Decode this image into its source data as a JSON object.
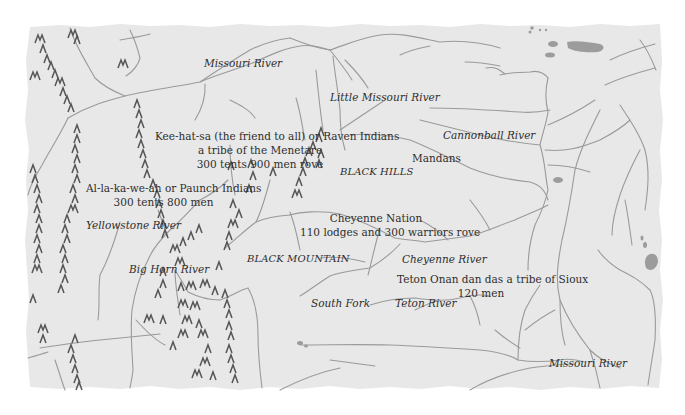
{
  "map": {
    "background_color": "#e8e8e8",
    "river_color": "#9a9a9a",
    "mountain_color": "#555555",
    "water_color": "#9c9c9c",
    "text_color": "#2e2e2e",
    "rivers": [
      {
        "id": "missouri-north",
        "label": "Missouri River"
      },
      {
        "id": "little-missouri",
        "label": "Little Missouri River"
      },
      {
        "id": "cannonball",
        "label": "Cannonball River"
      },
      {
        "id": "yellowstone",
        "label": "Yellowstone River"
      },
      {
        "id": "big-horn",
        "label": "Big Horn River"
      },
      {
        "id": "cheyenne",
        "label": "Cheyenne River"
      },
      {
        "id": "south-fork",
        "label": "South Fork"
      },
      {
        "id": "teton",
        "label": "Teton River"
      },
      {
        "id": "missouri-south",
        "label": "Missouri River"
      }
    ],
    "regions": [
      {
        "id": "black-hills",
        "label": "BLACK HILLS"
      },
      {
        "id": "black-mountain",
        "label": "BLACK MOUNTAIN"
      }
    ],
    "tribes": [
      {
        "id": "raven-indians",
        "lines": [
          "Kee-hat-sa (the friend to all) or Raven Indians",
          "a tribe of the Menetare",
          "300 tents 900 men rove"
        ]
      },
      {
        "id": "paunch-indians",
        "lines": [
          "Al-la-ka-we-ah or Paunch Indians",
          "300 tents 800 men"
        ]
      },
      {
        "id": "mandans",
        "lines": [
          "Mandans"
        ]
      },
      {
        "id": "cheyenne-nation",
        "lines": [
          "Cheyenne Nation",
          "110 lodges and 300 warriors rove"
        ]
      },
      {
        "id": "teton-sioux",
        "lines": [
          "Teton Onan dan das a tribe of Sioux",
          "120 men"
        ]
      }
    ]
  }
}
